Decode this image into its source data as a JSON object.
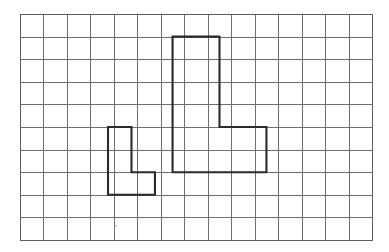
{
  "figure": {
    "background_color": "#ffffff",
    "grid": {
      "columns": 15,
      "rows": 10,
      "origin_x": 20,
      "origin_y": 14,
      "cell_width": 23.47,
      "cell_height": 22.6,
      "line_color": "#6f6f6f",
      "border_color": "#5d5d5d",
      "line_width": 1
    },
    "shapes": [
      {
        "name": "large-l-shape",
        "label": "Large L polygon",
        "stroke_color": "#2b2b2b",
        "stroke_width": 2.1,
        "fill": "none",
        "cell_count": 8,
        "grid_points": [
          [
            6.5,
            1
          ],
          [
            8.5,
            1
          ],
          [
            8.5,
            5
          ],
          [
            10.5,
            5
          ],
          [
            10.5,
            7
          ],
          [
            6.5,
            7
          ]
        ]
      },
      {
        "name": "small-l-shape",
        "label": "Small L polygon",
        "stroke_color": "#2b2b2b",
        "stroke_width": 2.1,
        "fill": "none",
        "cell_count": 4,
        "grid_points": [
          [
            3.75,
            5
          ],
          [
            4.75,
            5
          ],
          [
            4.75,
            7
          ],
          [
            5.75,
            7
          ],
          [
            5.75,
            8
          ],
          [
            3.75,
            8
          ]
        ]
      }
    ],
    "speck": {
      "name": "paper-speck",
      "x": 116,
      "y": 226,
      "radius": 1.1,
      "color": "#cfcfcf"
    }
  }
}
